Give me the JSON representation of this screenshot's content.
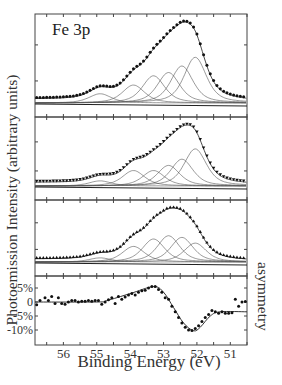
{
  "chart_data": {
    "type": "line",
    "title": "Fe 3p",
    "xlabel": "Binding Energy (eV)",
    "ylabel": "Photoemission Intensity (arbitrary units)",
    "ylabel_right": "asymmetry",
    "xlim": [
      56.85,
      50.5
    ],
    "x_reversed": true,
    "x_ticks": [
      56,
      55,
      54,
      53,
      52,
      51
    ],
    "grid": false,
    "panels": [
      {
        "name": "spectrum-1",
        "description": "Fe 3p photoemission spectrum with fitted components (top)",
        "peak_energy_eV": 52.1,
        "data_marker": "circle",
        "components_center_eV": [
          54.9,
          53.9,
          53.3,
          52.85,
          52.45,
          52.05
        ],
        "components_rel_height": [
          0.17,
          0.33,
          0.5,
          0.56,
          0.68,
          0.84
        ]
      },
      {
        "name": "spectrum-2",
        "description": "Fe 3p photoemission spectrum with fitted components (middle)",
        "peak_energy_eV": 52.1,
        "data_marker": "triangle-down",
        "components_center_eV": [
          54.9,
          53.9,
          53.3,
          52.85,
          52.45,
          52.05
        ],
        "components_rel_height": [
          0.1,
          0.3,
          0.3,
          0.4,
          0.52,
          0.72
        ]
      },
      {
        "name": "spectrum-3",
        "description": "Fe 3p photoemission spectrum with fitted components (lower)",
        "peak_energy_eV": 52.75,
        "data_marker": "triangle-up",
        "components_center_eV": [
          54.9,
          53.9,
          53.3,
          52.85,
          52.45,
          52.05
        ],
        "components_rel_height": [
          0.1,
          0.38,
          0.56,
          0.64,
          0.6,
          0.46
        ]
      },
      {
        "name": "asymmetry",
        "ylabel": "asymmetry",
        "y_ticks": [
          "5%",
          "0",
          "-5%",
          "-10%"
        ],
        "y_tick_values": [
          5,
          0,
          -5,
          -10
        ],
        "ylim": [
          -12,
          9.5
        ],
        "points_x": [
          56.8,
          56.7,
          56.55,
          56.45,
          56.35,
          56.25,
          56.15,
          56.05,
          55.95,
          55.85,
          55.75,
          55.65,
          55.55,
          55.45,
          55.35,
          55.25,
          55.15,
          55.05,
          54.95,
          54.85,
          54.75,
          54.65,
          54.55,
          54.45,
          54.35,
          54.25,
          54.15,
          54.05,
          53.95,
          53.85,
          53.75,
          53.65,
          53.55,
          53.45,
          53.35,
          53.25,
          53.15,
          53.05,
          52.95,
          52.85,
          52.75,
          52.65,
          52.55,
          52.45,
          52.35,
          52.25,
          52.15,
          52.05,
          51.95,
          51.85,
          51.75,
          51.65,
          51.55,
          51.45,
          51.35,
          51.25,
          51.15,
          51.05,
          50.95,
          50.85,
          50.75,
          50.65,
          50.55
        ],
        "points_y": [
          -1,
          0.5,
          1.5,
          0.5,
          2,
          -0.5,
          1.5,
          -0.5,
          -0.8,
          0,
          0.5,
          0.5,
          0,
          0.3,
          0.3,
          0.5,
          0.3,
          0.5,
          0.5,
          -0.8,
          0,
          0.8,
          1.5,
          -0.5,
          2,
          1,
          1.8,
          2.5,
          3,
          2.5,
          3.5,
          4,
          4.2,
          5,
          5.5,
          5.5,
          4.5,
          3.5,
          1.5,
          1,
          -1.5,
          -3.5,
          -5.5,
          -7.5,
          -9,
          -10,
          -10.2,
          -9.5,
          -8.5,
          -7,
          -5.5,
          -4.5,
          -3,
          -3.5,
          -4,
          -3.5,
          -4,
          -4,
          -3.8,
          1,
          -1.5,
          0,
          0.2
        ],
        "fit_x": [
          56.85,
          55.0,
          54.7,
          54.0,
          53.3,
          53.0,
          52.7,
          52.4,
          52.1,
          51.9,
          51.6,
          51.3,
          50.5
        ],
        "fit_y": [
          0,
          0,
          0.5,
          3,
          5.5,
          3.5,
          -2,
          -7.5,
          -10.3,
          -9,
          -5,
          -3.5,
          -3.5
        ]
      }
    ]
  }
}
